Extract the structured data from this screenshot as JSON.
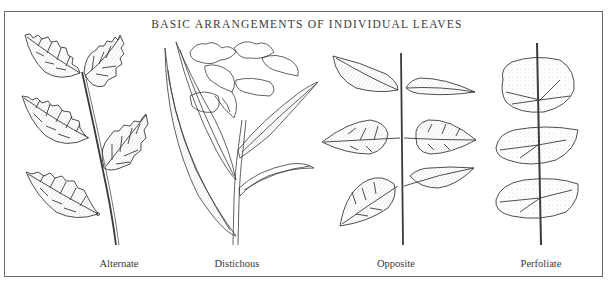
{
  "figure": {
    "title": "BASIC ARRANGEMENTS OF INDIVIDUAL LEAVES",
    "panels": [
      {
        "id": "alternate",
        "label": "Alternate",
        "center_x": 119
      },
      {
        "id": "distichous",
        "label": "Distichous",
        "center_x": 237
      },
      {
        "id": "opposite",
        "label": "Opposite",
        "center_x": 396
      },
      {
        "id": "perfoliate",
        "label": "Perfoliate",
        "center_x": 541
      }
    ],
    "colors": {
      "ink": "#3a3a3a",
      "frame": "#6a6a6a",
      "shade": "#c8c8c8",
      "background": "#ffffff"
    }
  }
}
